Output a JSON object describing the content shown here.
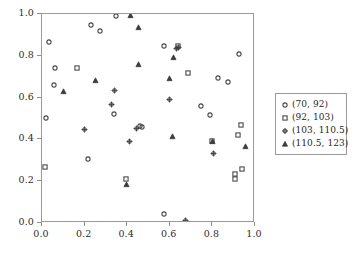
{
  "chart_data": {
    "type": "scatter",
    "title": "",
    "xlabel": "",
    "ylabel": "",
    "xlim": [
      0.0,
      1.0
    ],
    "ylim": [
      0.0,
      1.0
    ],
    "grid": false,
    "legend_position": "right",
    "xticks": [
      "0.0",
      "0.2",
      "0.4",
      "0.6",
      "0.8",
      "1.0"
    ],
    "xtick_values": [
      0.0,
      0.2,
      0.4,
      0.6,
      0.8,
      1.0
    ],
    "yticks": [
      "0.0",
      "0.2",
      "0.4",
      "0.6",
      "0.8",
      "1.0"
    ],
    "ytick_values": [
      0.0,
      0.2,
      0.4,
      0.6,
      0.8,
      1.0
    ],
    "series": [
      {
        "name": "(70, 92)",
        "marker": "circle",
        "color": "#4a4a4a",
        "points": [
          [
            0.03,
            0.87
          ],
          [
            0.057,
            0.742
          ],
          [
            0.052,
            0.663
          ],
          [
            0.018,
            0.505
          ],
          [
            0.213,
            0.31
          ],
          [
            0.226,
            0.948
          ],
          [
            0.272,
            0.92
          ],
          [
            0.334,
            0.523
          ],
          [
            0.345,
            0.995
          ],
          [
            0.459,
            0.465
          ],
          [
            0.468,
            0.463
          ],
          [
            0.571,
            0.849
          ],
          [
            0.571,
            0.047
          ],
          [
            0.742,
            0.56
          ],
          [
            0.785,
            0.52
          ],
          [
            0.826,
            0.698
          ],
          [
            0.872,
            0.678
          ],
          [
            0.921,
            0.811
          ]
        ]
      },
      {
        "name": "(92, 103)",
        "marker": "square",
        "color": "#4a4a4a",
        "points": [
          [
            0.01,
            0.268
          ],
          [
            0.16,
            0.742
          ],
          [
            0.391,
            0.215
          ],
          [
            0.636,
            0.848
          ],
          [
            0.681,
            0.722
          ],
          [
            0.796,
            0.397
          ],
          [
            0.905,
            0.239
          ],
          [
            0.905,
            0.213
          ],
          [
            0.917,
            0.425
          ],
          [
            0.931,
            0.471
          ],
          [
            0.936,
            0.262
          ]
        ]
      },
      {
        "name": "(103, 110.5)",
        "marker": "diamond",
        "color": "#3f3f3f",
        "points": [
          [
            0.196,
            0.452
          ],
          [
            0.323,
            0.571
          ],
          [
            0.334,
            0.641
          ],
          [
            0.406,
            0.395
          ],
          [
            0.44,
            0.455
          ],
          [
            0.596,
            0.597
          ],
          [
            0.629,
            0.842
          ],
          [
            0.634,
            0.846
          ],
          [
            0.67,
            0.015
          ],
          [
            0.802,
            0.335
          ]
        ]
      },
      {
        "name": "(110.5, 123)",
        "marker": "triangle",
        "color": "#3a3a3a",
        "points": [
          [
            0.098,
            0.632
          ],
          [
            0.247,
            0.688
          ],
          [
            0.391,
            0.19
          ],
          [
            0.412,
            1.0
          ],
          [
            0.449,
            0.941
          ],
          [
            0.449,
            0.765
          ],
          [
            0.594,
            0.697
          ],
          [
            0.606,
            0.418
          ],
          [
            0.615,
            0.795
          ],
          [
            0.796,
            0.396
          ],
          [
            0.952,
            0.372
          ]
        ]
      }
    ]
  }
}
